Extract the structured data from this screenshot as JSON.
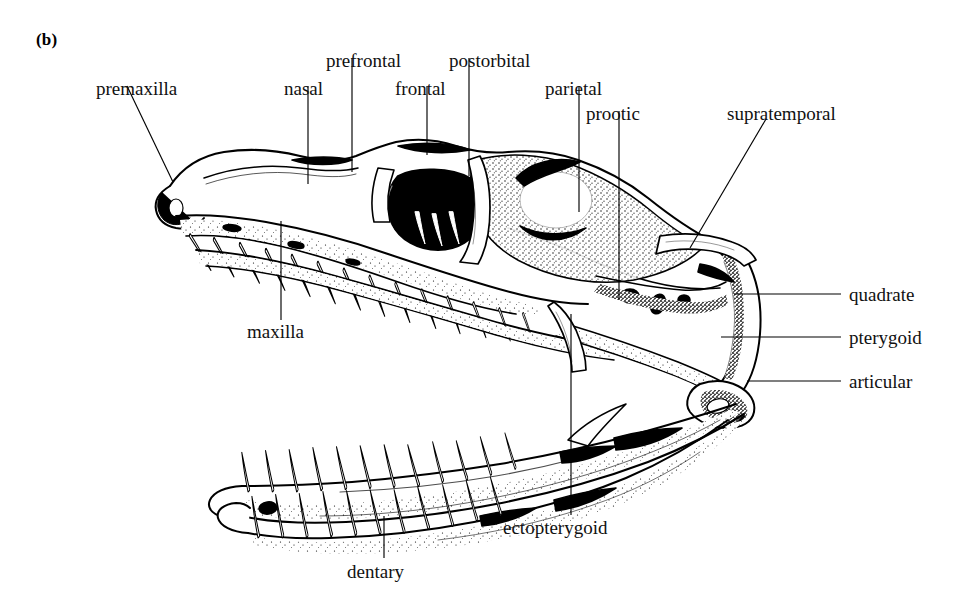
{
  "figure": {
    "panel_label": "(b)",
    "background_color": "#ffffff",
    "ink_color": "#000000"
  },
  "labels": [
    {
      "id": "premaxilla",
      "text": "premaxilla",
      "x": 96,
      "y": 79,
      "align": "left"
    },
    {
      "id": "nasal",
      "text": "nasal",
      "x": 284,
      "y": 79,
      "align": "left"
    },
    {
      "id": "prefrontal",
      "text": "prefrontal",
      "x": 326,
      "y": 51,
      "align": "left"
    },
    {
      "id": "frontal",
      "text": "frontal",
      "x": 395,
      "y": 79,
      "align": "left"
    },
    {
      "id": "postorbital",
      "text": "postorbital",
      "x": 449,
      "y": 51,
      "align": "left"
    },
    {
      "id": "parietal",
      "text": "parietal",
      "x": 545,
      "y": 79,
      "align": "left"
    },
    {
      "id": "prootic",
      "text": "prootic",
      "x": 586,
      "y": 104,
      "align": "left"
    },
    {
      "id": "supratemporal",
      "text": "supratemporal",
      "x": 727,
      "y": 104,
      "align": "left"
    },
    {
      "id": "quadrate",
      "text": "quadrate",
      "x": 849,
      "y": 301,
      "align": "left"
    },
    {
      "id": "pterygoid",
      "text": "pterygoid",
      "x": 849,
      "y": 344,
      "align": "left"
    },
    {
      "id": "articular",
      "text": "articular",
      "x": 849,
      "y": 388,
      "align": "left"
    },
    {
      "id": "maxilla",
      "text": "maxilla",
      "x": 247,
      "y": 338,
      "align": "left"
    },
    {
      "id": "ectopterygoid",
      "text": "ectopterygoid",
      "x": 503,
      "y": 534,
      "align": "left"
    },
    {
      "id": "dentary",
      "text": "dentary",
      "x": 347,
      "y": 578,
      "align": "left"
    }
  ],
  "leader_lines": [
    {
      "id": "premaxilla-leader",
      "points": "127,86 173,182"
    },
    {
      "id": "nasal-leader",
      "points": "308,86 308,184"
    },
    {
      "id": "prefrontal-leader",
      "points": "352,58 352,172"
    },
    {
      "id": "frontal-leader",
      "points": "427,86 427,155"
    },
    {
      "id": "postorbital-leader",
      "points": "469,58 469,176"
    },
    {
      "id": "parietal-leader",
      "points": "579,86 579,212"
    },
    {
      "id": "prootic-leader",
      "points": "619,111 619,300"
    },
    {
      "id": "supratemporal-leader",
      "points": "766,119 690,248"
    },
    {
      "id": "quadrate-leader",
      "points": "734,294 841,294"
    },
    {
      "id": "pterygoid-leader",
      "points": "721,337 841,337"
    },
    {
      "id": "articular-leader",
      "points": "747,381 841,381"
    },
    {
      "id": "maxilla-leader",
      "points": "281,221 281,320"
    },
    {
      "id": "ectopterygoid-leader",
      "points": "571,314 571,515"
    },
    {
      "id": "dentary-leader",
      "points": "384,516 384,558"
    }
  ]
}
